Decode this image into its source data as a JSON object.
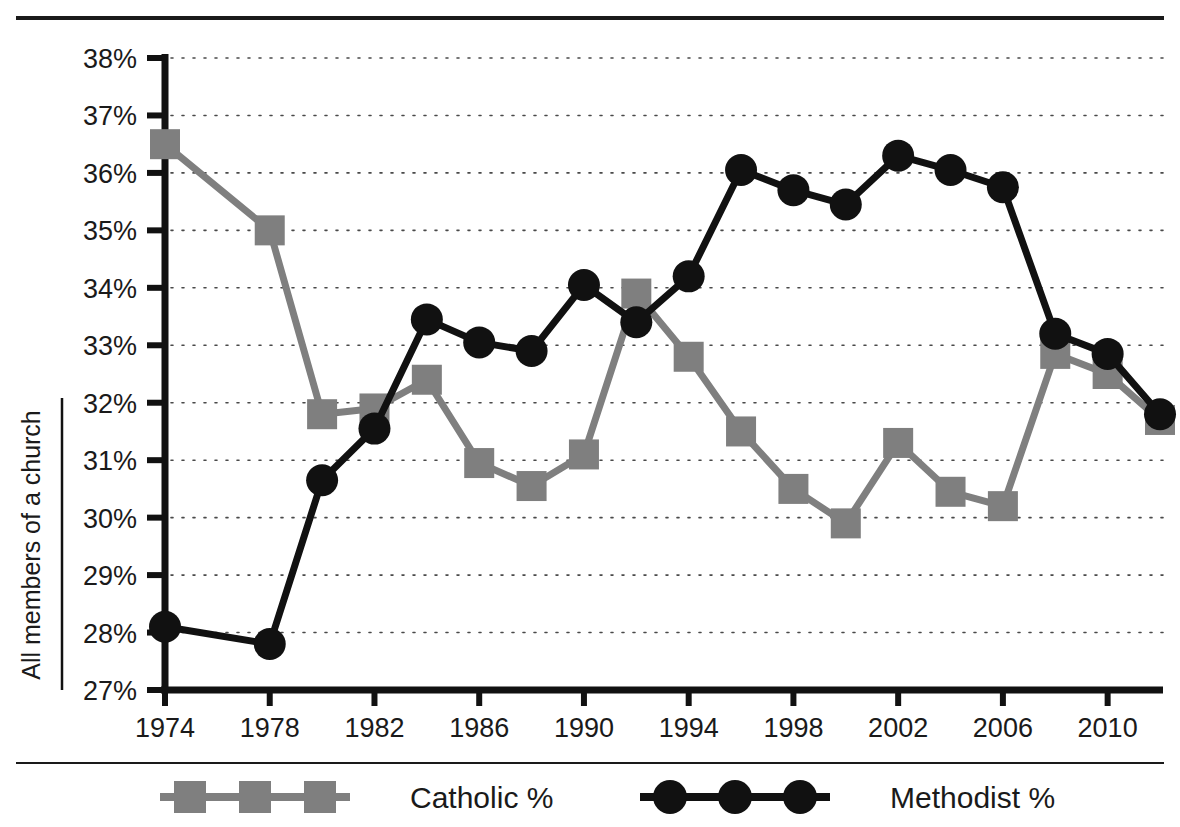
{
  "chart_data": {
    "type": "line",
    "title": "",
    "xlabel": "",
    "ylabel": "All members of a church",
    "xlim": [
      1974,
      2012
    ],
    "ylim": [
      27,
      38
    ],
    "y_tick_labels": [
      "38%",
      "37%",
      "36%",
      "35%",
      "34%",
      "33%",
      "32%",
      "31%",
      "30%",
      "29%",
      "28%",
      "27%"
    ],
    "y_tick_values": [
      38,
      37,
      36,
      35,
      34,
      33,
      32,
      31,
      30,
      29,
      28,
      27
    ],
    "x_tick_labels": [
      "1974",
      "1978",
      "1982",
      "1986",
      "1990",
      "1994",
      "1998",
      "2002",
      "2006",
      "2010"
    ],
    "x_tick_values": [
      1974,
      1978,
      1982,
      1986,
      1990,
      1994,
      1998,
      2002,
      2006,
      2010
    ],
    "x": [
      1974,
      1976,
      1978,
      1980,
      1982,
      1984,
      1986,
      1988,
      1990,
      1992,
      1994,
      1996,
      1998,
      2000,
      2002,
      2004,
      2006,
      2008,
      2010,
      2012
    ],
    "grid": "horizontal-dotted",
    "legend_position": "bottom",
    "series": [
      {
        "name": "Catholic %",
        "marker": "square",
        "color": "#7f7f7f",
        "values": [
          36.5,
          null,
          35.0,
          31.8,
          31.9,
          32.4,
          30.95,
          30.55,
          31.1,
          33.9,
          32.8,
          31.5,
          30.5,
          29.9,
          31.3,
          30.45,
          30.2,
          32.85,
          32.5,
          31.7
        ]
      },
      {
        "name": "Methodist %",
        "marker": "circle",
        "color": "#111111",
        "values": [
          28.1,
          null,
          27.8,
          30.65,
          31.55,
          33.45,
          33.05,
          32.9,
          34.05,
          33.4,
          34.2,
          36.05,
          35.7,
          35.45,
          36.3,
          36.05,
          35.75,
          33.2,
          32.85,
          31.8
        ]
      }
    ],
    "legend": [
      {
        "label": "Catholic %",
        "marker": "square",
        "color": "#7f7f7f"
      },
      {
        "label": "Methodist %",
        "marker": "circle",
        "color": "#111111"
      }
    ]
  }
}
